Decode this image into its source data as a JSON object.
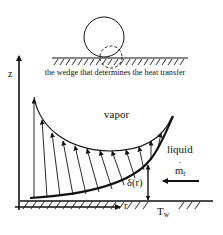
{
  "diagram": {
    "caption": "the wedge that determines the heat transfer",
    "axes": {
      "vertical_label": "z",
      "horizontal_label": "r"
    },
    "regions": {
      "vapor_label": "vapor",
      "liquid_label": "liquid"
    },
    "annotations": {
      "film_thickness_label": "δ(r)",
      "mass_flow_symbol": "m",
      "mass_flow_dot": "˙",
      "mass_flow_subscript": "r",
      "wall_temp_symbol": "T",
      "wall_temp_subscript": "w"
    },
    "elements": {
      "bubble": "circle on heated surface",
      "wedge_marker": "dashed circle at contact line",
      "velocity_arrows": "arrows from wall to liquid-vapor interface",
      "flow_arrow": "arrow pointing left toward meniscus"
    },
    "colors": {
      "stroke": "#111111",
      "background": "#ffffff"
    }
  }
}
